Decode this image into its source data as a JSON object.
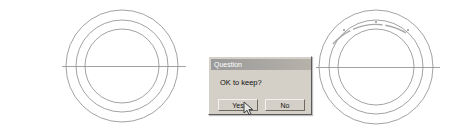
{
  "canvas": {
    "background_color": "#ffffff",
    "line_color": "#7a7a7a",
    "highlight_color": "#9b9b9b",
    "figures": [
      {
        "name": "left-concentric-circles",
        "center_x": 122,
        "center_y": 66,
        "radii": [
          56,
          46,
          37
        ],
        "has_horizontal_axis_line": true,
        "axis_line_x1": 62,
        "axis_line_x2": 186
      },
      {
        "name": "right-concentric-circles",
        "center_x": 376,
        "center_y": 67,
        "radii": [
          57,
          47,
          38
        ],
        "has_horizontal_axis_line": true,
        "axis_line_x1": 316,
        "axis_line_x2": 440,
        "top_arc_highlighted": true
      }
    ]
  },
  "dialog": {
    "title": "Question",
    "message": "OK to keep?",
    "buttons": [
      {
        "id": "yes",
        "label": "Yes"
      },
      {
        "id": "no",
        "label": "No"
      }
    ],
    "titlebar_color": "#9a9a9a",
    "face_color": "#d4d0c8"
  },
  "cursor": {
    "type": "arrow-pointer",
    "x": 243,
    "y": 101
  }
}
